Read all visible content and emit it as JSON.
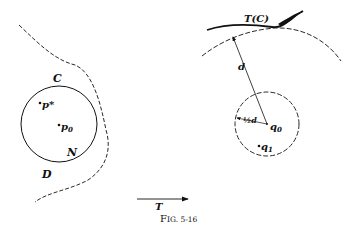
{
  "figure": {
    "caption": "Fig. 5-16",
    "caption_prefix": "F",
    "caption_rest": "IG. 5-16"
  },
  "left_panel": {
    "labels": {
      "curve_c": "C",
      "region_d": "D",
      "neighborhood_n": "N",
      "point_p_star": "p*",
      "point_p0": "p",
      "point_p0_sub": "0"
    }
  },
  "right_panel": {
    "labels": {
      "image_curve": "T(C)",
      "distance": "d",
      "half_distance": "½d",
      "point_q0": "q",
      "point_q0_sub": "0",
      "point_q1": "q",
      "point_q1_sub": "1"
    }
  },
  "mapping": {
    "arrow_label": "T"
  },
  "colors": {
    "ink": "#111111",
    "background": "#ffffff"
  }
}
